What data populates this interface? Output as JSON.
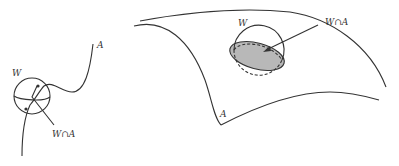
{
  "figure": {
    "left_panel": {
      "curve_label": "A",
      "ball_label": "W",
      "intersection_label": "W∩A"
    },
    "right_panel": {
      "surface_label": "A",
      "ball_label": "W",
      "intersection_label": "W∩A"
    },
    "colors": {
      "stroke": "#333333",
      "intersection_fill": "#b8b8b8",
      "background": "#ffffff"
    }
  }
}
